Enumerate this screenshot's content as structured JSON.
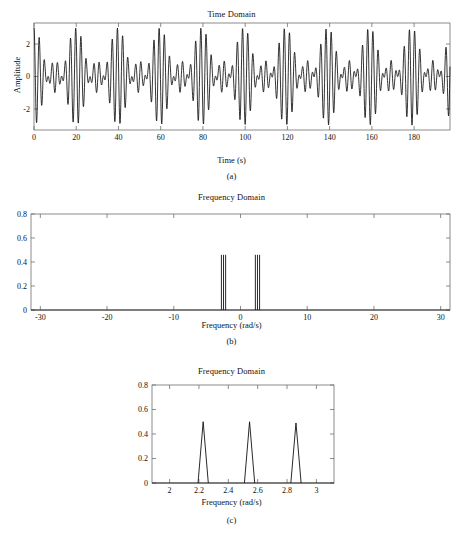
{
  "figure": {
    "panels": [
      {
        "id": "a",
        "caption": "(a)",
        "title": "Time Domain",
        "xlabel": "Time (s)",
        "ylabel": "Amplitude",
        "xticks": [
          "0",
          "20",
          "40",
          "60",
          "80",
          "100",
          "120",
          "140",
          "160",
          "180"
        ],
        "xtick_values": [
          0,
          20,
          40,
          60,
          80,
          100,
          120,
          140,
          160,
          180
        ],
        "yticks": [
          "-2",
          "0",
          "2"
        ],
        "ytick_values": [
          -2,
          0,
          2
        ]
      },
      {
        "id": "b",
        "caption": "(b)",
        "title": "Frequency Domain",
        "xlabel": "Frequency (rad/s)",
        "ylabel": "",
        "xticks": [
          "-30",
          "-20",
          "-10",
          "0",
          "10",
          "20",
          "30"
        ],
        "xtick_values": [
          -30,
          -20,
          -10,
          0,
          10,
          20,
          30
        ],
        "yticks": [
          "0",
          "0.2",
          "0.4",
          "0.6",
          "0.8"
        ],
        "ytick_values": [
          0,
          0.2,
          0.4,
          0.6,
          0.8
        ]
      },
      {
        "id": "c",
        "caption": "(c)",
        "title": "Frequency Domain",
        "xlabel": "Frequency (rad/s)",
        "ylabel": "",
        "xticks": [
          "2",
          "2.2",
          "2.4",
          "2.6",
          "2.8",
          "3"
        ],
        "xtick_values": [
          2,
          2.2,
          2.4,
          2.6,
          2.8,
          3
        ],
        "yticks": [
          "0",
          "0.2",
          "0.4",
          "0.6",
          "0.8"
        ],
        "ytick_values": [
          0,
          0.2,
          0.4,
          0.6,
          0.8
        ]
      }
    ]
  },
  "chart_data": [
    {
      "type": "line",
      "panel": "a",
      "title": "Time Domain",
      "xlabel": "Time (s)",
      "ylabel": "Amplitude",
      "xlim": [
        0,
        197
      ],
      "ylim": [
        -3.3,
        3.3
      ],
      "grid": false,
      "legend": "none",
      "description": "Sum of three unit-amplitude sinusoids at closely spaced frequencies producing a beating envelope with period about 20 s; peak amplitude reaches about +/-3.",
      "signal_model": {
        "form": "x(t) = cos(w1*t) + cos(w2*t) + cos(w3*t)",
        "omegas": [
          2.2286,
          2.5447,
          2.8609
        ],
        "amplitudes": [
          1.0,
          1.0,
          1.0
        ],
        "beat_period_s": 19.87,
        "sample_interval_s": 0.1,
        "envelope_peak": 3.0,
        "envelope_min": 0.6
      }
    },
    {
      "type": "line",
      "panel": "b",
      "title": "Frequency Domain",
      "xlabel": "Frequency (rad/s)",
      "ylabel": "",
      "xlim": [
        -31.4,
        31.4
      ],
      "ylim": [
        0,
        0.8
      ],
      "grid": false,
      "legend": "none",
      "description": "Magnitude spectrum over the full Nyquist range showing two mirror-image clusters of three narrow spikes near +/-2.2 to +/-2.9 rad/s; the rest of the band is flat at zero.",
      "x": [
        -2.8609,
        -2.5447,
        -2.2286,
        2.2286,
        2.5447,
        2.8609
      ],
      "values": [
        0.46,
        0.46,
        0.46,
        0.46,
        0.46,
        0.46
      ]
    },
    {
      "type": "line",
      "panel": "c",
      "title": "Frequency Domain",
      "xlabel": "Frequency (rad/s)",
      "ylabel": "",
      "xlim": [
        1.88,
        3.12
      ],
      "ylim": [
        0,
        0.8
      ],
      "grid": false,
      "legend": "none",
      "description": "Zoomed magnitude spectrum resolving three separate narrow triangular peaks of height about 0.5 at 2.23, 2.54 and 2.86 rad/s.",
      "x": [
        2.2286,
        2.5447,
        2.8609
      ],
      "values": [
        0.5,
        0.5,
        0.49
      ],
      "peak_half_width": 0.035
    }
  ]
}
